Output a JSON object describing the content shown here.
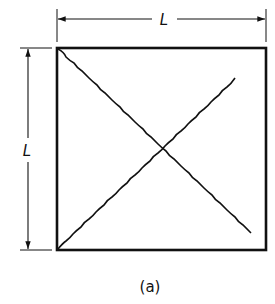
{
  "diagram": {
    "type": "square-panel-with-crossed-diagonals",
    "colors": {
      "stroke": "#111111",
      "background": "#ffffff"
    },
    "square": {
      "x": 57,
      "y": 48,
      "width": 209,
      "height": 202
    },
    "dimensions": {
      "top": {
        "label": "L"
      },
      "left": {
        "label": "L"
      }
    },
    "diagonals": [
      {
        "from": "top-left",
        "to": "bottom-right",
        "style": "wavy"
      },
      {
        "from": "bottom-left",
        "to": "top-right",
        "style": "wavy"
      }
    ],
    "caption": "(a)"
  }
}
